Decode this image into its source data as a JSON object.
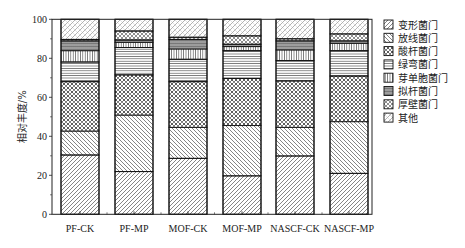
{
  "chart_data": {
    "type": "bar",
    "stacked": true,
    "title": "",
    "xlabel": "",
    "ylabel": "相对丰度/%",
    "ylim": [
      0,
      100
    ],
    "yticks": [
      0,
      20,
      40,
      60,
      80,
      100
    ],
    "grid": false,
    "legend_position": "right",
    "categories": [
      "PF-CK",
      "PF-MP",
      "MOF-CK",
      "MOF-MP",
      "NASCF-CK",
      "NASCF-MP"
    ],
    "series": [
      {
        "name": "变形菌门",
        "pattern": "diag-forward",
        "values": [
          30.4,
          21.9,
          28.7,
          19.7,
          29.9,
          21.0
        ]
      },
      {
        "name": "放线菌门",
        "pattern": "diag-back",
        "values": [
          12.3,
          29.0,
          15.9,
          25.8,
          14.7,
          26.5
        ]
      },
      {
        "name": "酸杆菌门",
        "pattern": "crosshatch-dots",
        "values": [
          25.3,
          20.6,
          23.4,
          24.2,
          23.8,
          23.4
        ]
      },
      {
        "name": "绿弯菌门",
        "pattern": "horizontal",
        "values": [
          10.1,
          14.0,
          11.5,
          14.2,
          10.4,
          13.0
        ]
      },
      {
        "name": "芽单胞菌门",
        "pattern": "vertical",
        "values": [
          5.8,
          2.7,
          5.3,
          2.1,
          5.5,
          3.8
        ]
      },
      {
        "name": "拟杆菌门",
        "pattern": "dense-vertical",
        "values": [
          5.0,
          1.2,
          4.9,
          1.2,
          4.6,
          1.2
        ]
      },
      {
        "name": "厚壁菌门",
        "pattern": "cross-diag",
        "values": [
          0.8,
          4.6,
          1.1,
          4.3,
          1.1,
          3.6
        ]
      },
      {
        "name": "其他",
        "pattern": "sparse-diag",
        "values": [
          10.3,
          6.0,
          9.2,
          8.5,
          10.0,
          7.5
        ]
      }
    ]
  }
}
